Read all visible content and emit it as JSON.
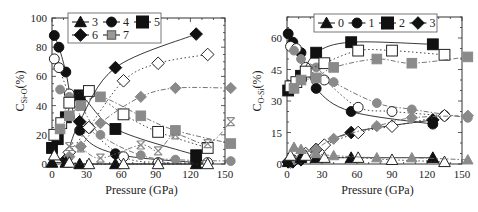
{
  "chart_data": [
    {
      "type": "line",
      "panel": "left",
      "title": "",
      "xlabel": "Pressure (GPa)",
      "ylabel": "C_Si-O(%)",
      "ylabel_main": "C",
      "ylabel_sub": "Si-O",
      "ylabel_tail": "(%)",
      "xlim": [
        0,
        150
      ],
      "ylim": [
        0,
        100
      ],
      "xticks": [
        "0",
        "30",
        "60",
        "90",
        "120",
        "150"
      ],
      "yticks": [
        "0",
        "20",
        "40",
        "60",
        "80",
        "100"
      ],
      "legend": [
        {
          "label": "3",
          "marker": "triangle"
        },
        {
          "label": "4",
          "marker": "circle"
        },
        {
          "label": "5",
          "marker": "square"
        },
        {
          "label": "6",
          "marker": "diamond"
        },
        {
          "label": "7",
          "marker": "cross"
        }
      ],
      "legend_position": "upper center",
      "series": [
        {
          "name": "4",
          "style": "black-solid",
          "marker": "circle",
          "x": [
            2,
            6,
            12,
            24,
            55,
            125
          ],
          "y": [
            88,
            80,
            63,
            23,
            7,
            1
          ]
        },
        {
          "name": "4",
          "style": "open-dotted",
          "marker": "circle",
          "x": [
            2,
            6,
            15,
            32,
            62,
            92,
            135
          ],
          "y": [
            72,
            66,
            48,
            25,
            5,
            1,
            1
          ]
        },
        {
          "name": "4",
          "style": "gray-dashdot",
          "marker": "circle",
          "x": [
            7,
            15,
            25,
            42,
            77,
            107,
            155
          ],
          "y": [
            51,
            46,
            40,
            20,
            6,
            3,
            2
          ]
        },
        {
          "name": "5",
          "style": "black-solid",
          "marker": "square",
          "x": [
            0,
            5,
            12,
            24,
            55,
            125
          ],
          "y": [
            11,
            17,
            32,
            47,
            24,
            6
          ]
        },
        {
          "name": "5",
          "style": "open-dotted",
          "marker": "square",
          "x": [
            2,
            8,
            15,
            32,
            62,
            92,
            135
          ],
          "y": [
            20,
            28,
            42,
            50,
            34,
            22,
            11
          ]
        },
        {
          "name": "5",
          "style": "gray-dashdot",
          "marker": "square",
          "x": [
            7,
            15,
            25,
            42,
            77,
            107,
            155
          ],
          "y": [
            24,
            33,
            40,
            46,
            33,
            23,
            14
          ]
        },
        {
          "name": "6",
          "style": "black-solid",
          "marker": "diamond",
          "x": [
            12,
            24,
            55,
            125
          ],
          "y": [
            3,
            29,
            66,
            89
          ]
        },
        {
          "name": "6",
          "style": "open-dotted",
          "marker": "diamond",
          "x": [
            15,
            32,
            62,
            92,
            135
          ],
          "y": [
            8,
            25,
            57,
            69,
            75
          ]
        },
        {
          "name": "6",
          "style": "gray-dashdot",
          "marker": "diamond",
          "x": [
            15,
            25,
            42,
            77,
            107,
            155
          ],
          "y": [
            5,
            12,
            28,
            46,
            52,
            52
          ]
        },
        {
          "name": "3",
          "style": "black-solid",
          "marker": "triangle",
          "x": [
            0,
            12,
            24,
            55,
            125
          ],
          "y": [
            1,
            1,
            0,
            0,
            0
          ]
        },
        {
          "name": "3",
          "style": "open-dotted",
          "marker": "triangle",
          "x": [
            2,
            15,
            32,
            62,
            92,
            135
          ],
          "y": [
            6,
            1,
            0,
            0,
            0,
            0
          ]
        },
        {
          "name": "7",
          "style": "gray-dashdot",
          "marker": "cross",
          "x": [
            15,
            25,
            42,
            77,
            92,
            107,
            135,
            155
          ],
          "y": [
            12,
            11,
            4,
            13,
            9,
            20,
            14,
            29
          ]
        }
      ],
      "grid": false
    },
    {
      "type": "line",
      "panel": "right",
      "title": "",
      "xlabel": "Pressure (GPa)",
      "ylabel": "C_O-Si(%)",
      "ylabel_main": "C",
      "ylabel_sub": "O-Si",
      "ylabel_tail": "(%)",
      "xlim": [
        0,
        150
      ],
      "ylim": [
        0,
        70
      ],
      "xticks": [
        "0",
        "30",
        "60",
        "90",
        "120",
        "150"
      ],
      "yticks": [
        "0",
        "15",
        "30",
        "45",
        "60"
      ],
      "legend": [
        {
          "label": "0",
          "marker": "triangle"
        },
        {
          "label": "1",
          "marker": "circle"
        },
        {
          "label": "2",
          "marker": "square"
        },
        {
          "label": "3",
          "marker": "diamond"
        }
      ],
      "legend_position": "upper center",
      "series": [
        {
          "name": "1",
          "style": "black-solid",
          "marker": "circle",
          "x": [
            1,
            5,
            12,
            25,
            55,
            125
          ],
          "y": [
            62,
            58,
            53,
            36,
            25,
            19
          ]
        },
        {
          "name": "1",
          "style": "open-dotted",
          "marker": "circle",
          "x": [
            3,
            8,
            16,
            32,
            61,
            90,
            135
          ],
          "y": [
            56,
            55,
            46,
            40,
            27,
            25,
            23
          ]
        },
        {
          "name": "1",
          "style": "gray-dashdot",
          "marker": "circle",
          "x": [
            6,
            12,
            25,
            40,
            77,
            107,
            155
          ],
          "y": [
            54,
            50,
            46,
            39,
            29,
            26,
            22
          ]
        },
        {
          "name": "2",
          "style": "black-solid",
          "marker": "square",
          "x": [
            1,
            5,
            12,
            25,
            55,
            125
          ],
          "y": [
            35,
            37,
            42,
            53,
            58,
            57
          ]
        },
        {
          "name": "2",
          "style": "open-dotted",
          "marker": "square",
          "x": [
            3,
            8,
            16,
            32,
            61,
            90,
            135
          ],
          "y": [
            37,
            39,
            44,
            48,
            54,
            54,
            52
          ]
        },
        {
          "name": "2",
          "style": "gray-dashdot",
          "marker": "square",
          "x": [
            6,
            12,
            25,
            40,
            77,
            107,
            155
          ],
          "y": [
            36,
            40,
            41,
            46,
            50,
            48,
            51
          ]
        },
        {
          "name": "3",
          "style": "black-solid",
          "marker": "diamond",
          "x": [
            1,
            5,
            12,
            25,
            55,
            125
          ],
          "y": [
            1,
            1,
            2,
            7,
            15,
            21
          ]
        },
        {
          "name": "3",
          "style": "open-dotted",
          "marker": "diamond",
          "x": [
            3,
            16,
            32,
            61,
            90,
            135
          ],
          "y": [
            1,
            5,
            9,
            15,
            18,
            23
          ]
        },
        {
          "name": "3",
          "style": "gray-dashdot",
          "marker": "diamond",
          "x": [
            6,
            12,
            25,
            40,
            77,
            107,
            155
          ],
          "y": [
            2,
            3,
            7,
            12,
            18,
            22,
            23
          ]
        },
        {
          "name": "0",
          "style": "black-solid",
          "marker": "triangle",
          "x": [
            1,
            12,
            25,
            55,
            125
          ],
          "y": [
            1,
            3,
            3,
            3,
            3
          ]
        },
        {
          "name": "0",
          "style": "open-dotted",
          "marker": "triangle",
          "x": [
            3,
            16,
            32,
            61,
            90,
            135
          ],
          "y": [
            4,
            4,
            3,
            3,
            2,
            1
          ]
        },
        {
          "name": "0",
          "style": "gray-dashdot",
          "marker": "triangle",
          "x": [
            6,
            12,
            25,
            40,
            77,
            107,
            155
          ],
          "y": [
            8,
            7,
            5,
            4,
            3,
            3,
            2
          ]
        }
      ],
      "grid": false
    }
  ]
}
